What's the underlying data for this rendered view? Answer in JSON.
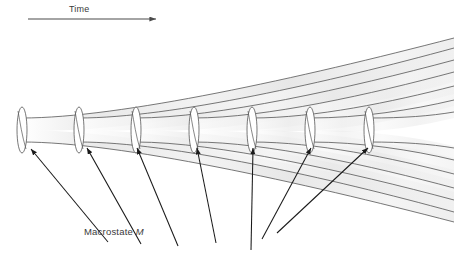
{
  "figure": {
    "type": "diagram",
    "background_color": "#ffffff",
    "line_color": "#4a4a4a",
    "arrow_color": "#1a1a1a",
    "shade_color": "#ebebeb",
    "text_color": "#3a3a3a"
  },
  "time_axis": {
    "label": "Time",
    "icon": "arrow-right-icon",
    "x_start": 28,
    "x_end": 158,
    "y": 19
  },
  "caption": {
    "text_prefix": "Macrostate ",
    "symbol": "M",
    "full_text": "Macrostate M"
  },
  "macrostates": [
    {
      "id": 1,
      "cx": 22,
      "cy": 130,
      "rx": 5,
      "ry": 23
    },
    {
      "id": 2,
      "cx": 79,
      "cy": 130,
      "rx": 5,
      "ry": 23
    },
    {
      "id": 3,
      "cx": 136,
      "cy": 130,
      "rx": 5,
      "ry": 23
    },
    {
      "id": 4,
      "cx": 194,
      "cy": 130,
      "rx": 5,
      "ry": 23
    },
    {
      "id": 5,
      "cx": 252,
      "cy": 130,
      "rx": 5,
      "ry": 23
    },
    {
      "id": 6,
      "cx": 310,
      "cy": 130,
      "rx": 5,
      "ry": 23
    },
    {
      "id": 7,
      "cx": 369,
      "cy": 130,
      "rx": 5,
      "ry": 23
    }
  ],
  "pointer_arrows": [
    {
      "id": 1,
      "x1": 108,
      "y1": 242,
      "x2": 30,
      "y2": 148
    },
    {
      "id": 2,
      "x1": 141,
      "y1": 244,
      "x2": 86,
      "y2": 147
    },
    {
      "id": 3,
      "x1": 178,
      "y1": 246,
      "x2": 136,
      "y2": 147
    },
    {
      "id": 4,
      "x1": 216,
      "y1": 242,
      "x2": 196,
      "y2": 147
    },
    {
      "id": 5,
      "x1": 250,
      "y1": 249,
      "x2": 252,
      "y2": 147
    },
    {
      "id": 6,
      "x1": 262,
      "y1": 238,
      "x2": 310,
      "y2": 147
    },
    {
      "id": 7,
      "x1": 276,
      "y1": 232,
      "x2": 368,
      "y2": 147
    }
  ],
  "upper_curves": [
    {
      "id": 1,
      "start_x": 22,
      "start_y": 118,
      "note": "top fan branch from macrostate 1"
    },
    {
      "id": 2,
      "start_x": 79,
      "start_y": 118,
      "note": "top fan branch from macrostate 2"
    },
    {
      "id": 3,
      "start_x": 136,
      "start_y": 118,
      "note": "top fan branch from macrostate 3"
    },
    {
      "id": 4,
      "start_x": 194,
      "start_y": 118,
      "note": "top fan branch from macrostate 4"
    },
    {
      "id": 5,
      "start_x": 252,
      "start_y": 118,
      "note": "top fan branch from macrostate 5"
    },
    {
      "id": 6,
      "start_x": 310,
      "start_y": 118,
      "note": "top fan branch from macrostate 6"
    },
    {
      "id": 7,
      "start_x": 369,
      "start_y": 118,
      "note": "top fan branch from macrostate 7"
    }
  ],
  "lower_curves": [
    {
      "id": 1,
      "start_x": 22,
      "start_y": 142,
      "note": "bottom fan branch from macrostate 1"
    },
    {
      "id": 2,
      "start_x": 79,
      "start_y": 142,
      "note": "bottom fan branch from macrostate 2"
    },
    {
      "id": 3,
      "start_x": 136,
      "start_y": 142,
      "note": "bottom fan branch from macrostate 3"
    },
    {
      "id": 4,
      "start_x": 194,
      "start_y": 142,
      "note": "bottom fan branch from macrostate 4"
    },
    {
      "id": 5,
      "start_x": 252,
      "start_y": 142,
      "note": "bottom fan branch from macrostate 5"
    },
    {
      "id": 6,
      "start_x": 310,
      "start_y": 142,
      "note": "bottom fan branch from macrostate 6"
    },
    {
      "id": 7,
      "start_x": 369,
      "start_y": 142,
      "note": "bottom fan branch from macrostate 7"
    }
  ]
}
